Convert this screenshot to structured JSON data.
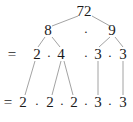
{
  "diagram": {
    "type": "factor-tree",
    "root": "72",
    "level1": {
      "left": "8",
      "op": "·",
      "right": "9"
    },
    "level2": {
      "eq": "=",
      "items": [
        "2",
        "·",
        "4",
        "·",
        "3",
        "·",
        "3"
      ]
    },
    "level3": {
      "eq": "=",
      "items": [
        "2",
        "·",
        "2",
        "·",
        "2",
        "·",
        "3",
        "·",
        "3"
      ]
    },
    "line_color": "#8c8c8c"
  }
}
